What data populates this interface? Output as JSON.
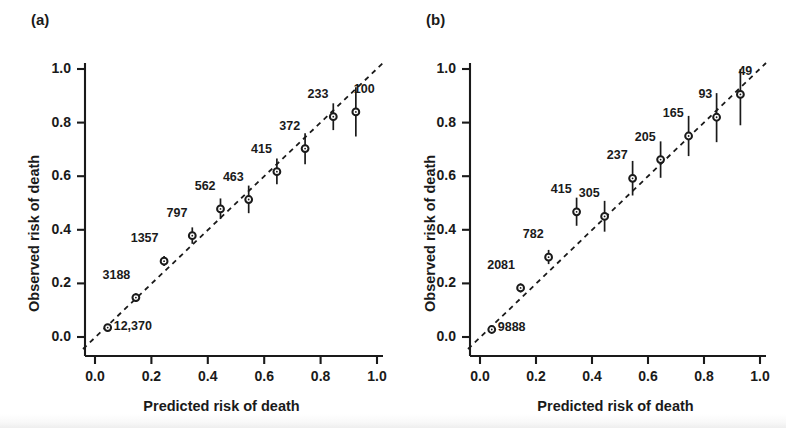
{
  "figure": {
    "width": 786,
    "height": 428,
    "background": "#ffffff",
    "ink_color": "#1a1a1a"
  },
  "panels": [
    {
      "letter": "(a)",
      "xlabel": "Predicted risk of death",
      "ylabel": "Observed risk of death",
      "xticks": [
        "0.0",
        "0.2",
        "0.4",
        "0.6",
        "0.8",
        "1.0"
      ],
      "yticks": [
        "0.0",
        "0.2",
        "0.4",
        "0.6",
        "0.8",
        "1.0"
      ]
    },
    {
      "letter": "(b)",
      "xlabel": "Predicted risk of death",
      "ylabel": "Observed risk of death",
      "xticks": [
        "0.0",
        "0.2",
        "0.4",
        "0.6",
        "0.8",
        "1.0"
      ],
      "yticks": [
        "0.0",
        "0.2",
        "0.4",
        "0.6",
        "0.8",
        "1.0"
      ]
    }
  ],
  "chart_data": [
    {
      "type": "scatter",
      "panel": "(a)",
      "title": "(a)",
      "xlabel": "Predicted risk of death",
      "ylabel": "Observed risk of death",
      "xlim": [
        0.0,
        1.0
      ],
      "ylim": [
        0.0,
        1.0
      ],
      "xticks": [
        0.0,
        0.2,
        0.4,
        0.6,
        0.8,
        1.0
      ],
      "yticks": [
        0.0,
        0.2,
        0.4,
        0.6,
        0.8,
        1.0
      ],
      "grid": false,
      "legend": "none",
      "reference_line": {
        "type": "dashed-identity",
        "from": [
          0.0,
          0.0
        ],
        "to": [
          1.0,
          1.0
        ]
      },
      "x": [
        0.045,
        0.145,
        0.245,
        0.345,
        0.445,
        0.545,
        0.645,
        0.745,
        0.845,
        0.925
      ],
      "y": [
        0.035,
        0.147,
        0.283,
        0.378,
        0.478,
        0.513,
        0.617,
        0.703,
        0.822,
        0.84
      ],
      "ci_low": [
        0.025,
        0.131,
        0.265,
        0.348,
        0.44,
        0.462,
        0.57,
        0.645,
        0.772,
        0.748
      ],
      "ci_high": [
        0.048,
        0.163,
        0.302,
        0.409,
        0.517,
        0.565,
        0.666,
        0.76,
        0.872,
        0.932
      ],
      "point_labels": [
        "12,370",
        "3188",
        "1357",
        "797",
        "562",
        "463",
        "415",
        "372",
        "233",
        "100"
      ],
      "label_positions": [
        "right",
        "above-left",
        "above-left",
        "above-left",
        "above-left",
        "above-left",
        "above-left",
        "above-left",
        "above-left",
        "above-right"
      ]
    },
    {
      "type": "scatter",
      "panel": "(b)",
      "title": "(b)",
      "xlabel": "Predicted risk of death",
      "ylabel": "Observed risk of death",
      "xlim": [
        0.0,
        1.0
      ],
      "ylim": [
        0.0,
        1.0
      ],
      "xticks": [
        0.0,
        0.2,
        0.4,
        0.6,
        0.8,
        1.0
      ],
      "yticks": [
        0.0,
        0.2,
        0.4,
        0.6,
        0.8,
        1.0
      ],
      "grid": false,
      "legend": "none",
      "reference_line": {
        "type": "dashed-identity",
        "from": [
          0.0,
          0.0
        ],
        "to": [
          1.0,
          1.0
        ]
      },
      "x": [
        0.042,
        0.145,
        0.245,
        0.345,
        0.445,
        0.545,
        0.645,
        0.745,
        0.845,
        0.93
      ],
      "y": [
        0.028,
        0.183,
        0.298,
        0.467,
        0.45,
        0.592,
        0.662,
        0.75,
        0.82,
        0.905
      ],
      "ci_low": [
        0.018,
        0.166,
        0.272,
        0.415,
        0.393,
        0.528,
        0.594,
        0.675,
        0.727,
        0.79
      ],
      "ci_high": [
        0.039,
        0.2,
        0.325,
        0.52,
        0.508,
        0.657,
        0.73,
        0.825,
        0.91,
        1.0
      ],
      "point_labels": [
        "9888",
        "2081",
        "782",
        "415",
        "305",
        "237",
        "205",
        "165",
        "93",
        "49"
      ],
      "label_positions": [
        "right",
        "above-left",
        "above-left",
        "above-left",
        "above-left",
        "above-left",
        "above-left",
        "above-left",
        "above-left",
        "above-right"
      ]
    }
  ]
}
